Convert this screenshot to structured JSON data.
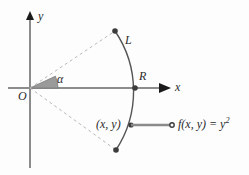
{
  "figure": {
    "type": "geometry-diagram",
    "background_color": "#fdfdfd",
    "width": 249,
    "height": 175,
    "axes": {
      "x_label": "x",
      "y_label": "y",
      "origin_label": "O",
      "axis_color": "#8c8c8c",
      "arrow_color": "#1a1a1a"
    },
    "labels": {
      "angle": "α",
      "arc": "L",
      "radius": "R",
      "point": "(x, y)",
      "formula_head": "f(x, y) = y",
      "formula_exponent": "2"
    },
    "colors": {
      "dashed_ray": "#b9b9b9",
      "arc_stroke": "#555555",
      "wedge_fill": "#9a9a9a",
      "wedge_stroke": "#7a7a7a",
      "marker_fill": "#3c3c3c",
      "connector": "#8a8a8a",
      "text": "#2b2b2b"
    },
    "geometry": {
      "origin": [
        30,
        88
      ],
      "arc_radius_point": [
        135,
        88
      ],
      "arc_top_endpoint": [
        115,
        31
      ],
      "arc_bottom_endpoint": [
        116,
        150
      ],
      "sample_point": [
        131,
        125
      ],
      "connector_end": [
        172,
        125
      ],
      "wedge_radius": 28,
      "angle_start_deg": 0,
      "angle_end_deg": 25
    }
  }
}
